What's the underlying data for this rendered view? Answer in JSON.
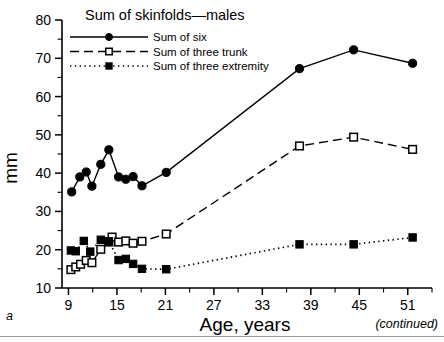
{
  "figure": {
    "panel_letter": "a",
    "continued_note": "(continued)",
    "legend_title": "Sum of skinfolds—males"
  },
  "axes": {
    "y_label": "mm",
    "x_label": "Age, years",
    "y_ticks": [
      10,
      20,
      30,
      40,
      50,
      60,
      70,
      80
    ],
    "x_ticks": [
      9,
      15,
      21,
      27,
      33,
      39,
      45,
      51
    ],
    "y_minor_step": 5,
    "x_minor_step": 3
  },
  "legend": {
    "items": [
      {
        "label": "Sum of six",
        "style": "solid",
        "marker": "filled-circle"
      },
      {
        "label": "Sum of three trunk",
        "style": "dashed",
        "marker": "open-square"
      },
      {
        "label": "Sum of three extremity",
        "style": "dotted",
        "marker": "filled-square"
      }
    ]
  },
  "chart_data": {
    "type": "line",
    "title": "Sum of skinfolds—males",
    "xlabel": "Age, years",
    "ylabel": "mm",
    "xlim": [
      8.2,
      54.0
    ],
    "ylim": [
      10,
      80
    ],
    "grid": false,
    "legend_position": "top-left",
    "annotations": [
      "a",
      "(continued)"
    ],
    "series": [
      {
        "name": "Sum of six",
        "style": "solid",
        "marker": "filled-circle",
        "color": "#000000",
        "points": [
          [
            9.4,
            35.1
          ],
          [
            10.4,
            39.0
          ],
          [
            11.2,
            40.3
          ],
          [
            11.9,
            36.6
          ],
          [
            13.0,
            42.3
          ],
          [
            14.0,
            46.1
          ],
          [
            15.2,
            39.0
          ],
          [
            16.1,
            38.4
          ],
          [
            17.0,
            39.1
          ],
          [
            18.1,
            36.7
          ],
          [
            21.1,
            40.2
          ],
          [
            37.6,
            67.3
          ],
          [
            44.3,
            72.2
          ],
          [
            51.6,
            68.7
          ]
        ]
      },
      {
        "name": "Sum of three trunk",
        "style": "dashed",
        "marker": "open-square",
        "color": "#000000",
        "points": [
          [
            9.3,
            14.8
          ],
          [
            9.9,
            15.5
          ],
          [
            10.5,
            16.2
          ],
          [
            11.2,
            17.2
          ],
          [
            11.9,
            16.6
          ],
          [
            13.0,
            20.1
          ],
          [
            14.0,
            22.0
          ],
          [
            14.4,
            23.3
          ],
          [
            15.2,
            22.0
          ],
          [
            16.1,
            22.3
          ],
          [
            17.0,
            21.7
          ],
          [
            18.1,
            22.2
          ],
          [
            21.1,
            24.1
          ],
          [
            37.6,
            47.1
          ],
          [
            44.3,
            49.4
          ],
          [
            51.6,
            46.2
          ]
        ]
      },
      {
        "name": "Sum of three extremity",
        "style": "dotted",
        "marker": "filled-square",
        "color": "#000000",
        "points": [
          [
            9.3,
            19.8
          ],
          [
            9.9,
            19.6
          ],
          [
            10.9,
            22.3
          ],
          [
            11.7,
            19.5
          ],
          [
            13.0,
            22.6
          ],
          [
            14.0,
            22.2
          ],
          [
            15.2,
            17.3
          ],
          [
            16.1,
            17.6
          ],
          [
            17.0,
            16.3
          ],
          [
            18.1,
            15.0
          ],
          [
            21.1,
            14.9
          ],
          [
            37.6,
            21.4
          ],
          [
            44.3,
            21.4
          ],
          [
            51.6,
            23.2
          ]
        ]
      }
    ]
  }
}
